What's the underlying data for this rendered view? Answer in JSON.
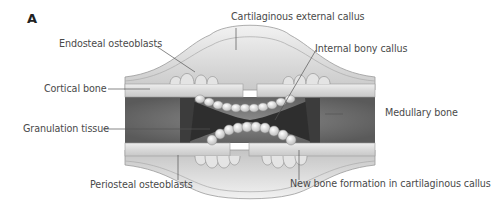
{
  "figure": {
    "panel_label": "A",
    "colors": {
      "cortical_bone": "#dedede",
      "medullary": "#7a7a7a",
      "granulation": "#3a3a3a",
      "callus": "#cfcfcf",
      "label_text": "#4a4a4a"
    },
    "labels": {
      "cartilaginous_external_callus": "Cartilaginous external callus",
      "endosteal_osteoblasts": "Endosteal osteoblasts",
      "internal_bony_callus": "Internal bony callus",
      "cortical_bone": "Cortical bone",
      "medullary_bone": "Medullary bone",
      "granulation_tissue": "Granulation tissue",
      "periosteal_osteoblasts": "Periosteal osteoblasts",
      "new_bone_formation": "New bone formation in cartilaginous callus"
    }
  }
}
